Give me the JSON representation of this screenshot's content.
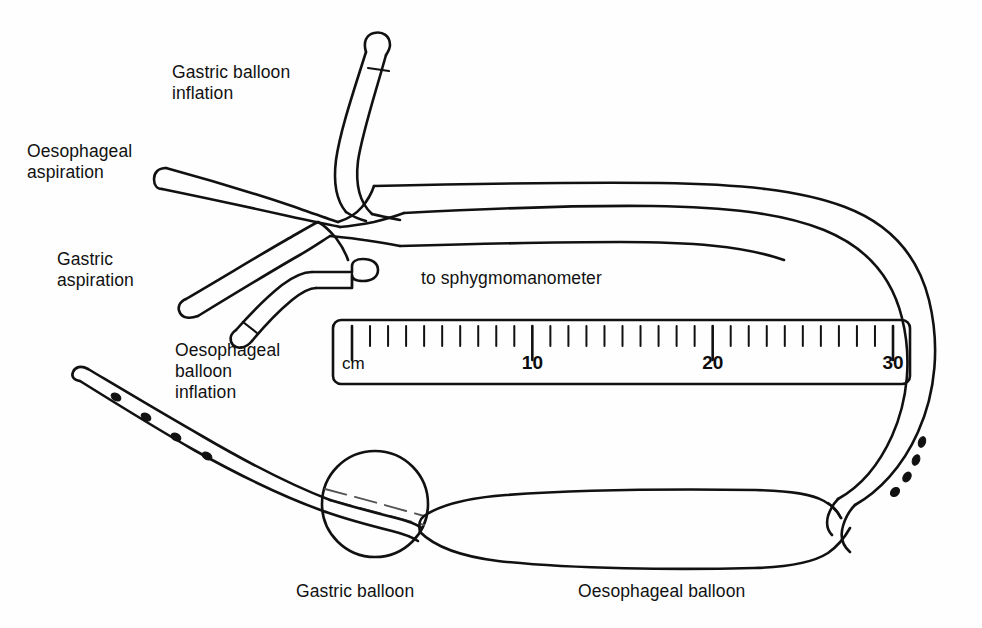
{
  "figure": {
    "background_color": "#fefefe",
    "ink_color": "#111111"
  },
  "labels": {
    "gastric_balloon_inflation": "Gastric balloon\ninflation",
    "oesophageal_aspiration": "Oesophageal\naspiration",
    "gastric_aspiration": "Gastric\naspiration",
    "oesophageal_balloon_inflation": "Oesophageal\nballoon\ninflation",
    "to_sphygmomanometer": "to sphygmomanometer",
    "gastric_balloon": "Gastric balloon",
    "oesophageal_balloon": "Oesophageal balloon"
  },
  "ruler": {
    "unit": "cm",
    "min": 0,
    "max": 30,
    "minor_tick_interval": 1,
    "major_ticks": [
      10,
      20,
      30
    ],
    "major_tick_labels": [
      "10",
      "20",
      "30"
    ],
    "tick_count": 31
  },
  "parts": [
    {
      "name": "gastric-balloon-inflation-lumen",
      "label": "Gastric balloon inflation"
    },
    {
      "name": "oesophageal-aspiration-lumen",
      "label": "Oesophageal aspiration"
    },
    {
      "name": "gastric-aspiration-lumen",
      "label": "Gastric aspiration"
    },
    {
      "name": "oesophageal-balloon-inflation-lumen",
      "label": "Oesophageal balloon inflation"
    },
    {
      "name": "sphygmomanometer-connector",
      "label": "to sphygmomanometer"
    },
    {
      "name": "gastric-balloon",
      "label": "Gastric balloon"
    },
    {
      "name": "oesophageal-balloon",
      "label": "Oesophageal balloon"
    }
  ],
  "drainage_holes": {
    "distal_tip_count": 4,
    "right_limb_count": 4
  }
}
